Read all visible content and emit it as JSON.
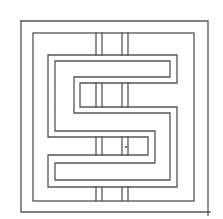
{
  "figure": {
    "line_color": "#555555",
    "background_color": "#ffffff",
    "frames": [
      {
        "name": "outer-frame",
        "x": 21,
        "y": 21,
        "w": 187,
        "h": 191
      },
      {
        "name": "inner-frame",
        "x": 33,
        "y": 33,
        "w": 161,
        "h": 168
      }
    ],
    "bars": [
      {
        "name": "bar-left",
        "x1": 96,
        "x2": 102
      },
      {
        "name": "bar-right",
        "x1": 122,
        "x2": 128
      }
    ]
  }
}
